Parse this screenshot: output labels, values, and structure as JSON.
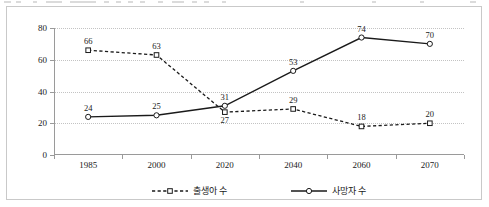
{
  "chart_data": {
    "type": "line",
    "title": "",
    "xlabel": "",
    "ylabel": "",
    "categories": [
      "1985",
      "2000",
      "2020",
      "2040",
      "2060",
      "2070"
    ],
    "ylim": [
      0,
      80
    ],
    "yticks": [
      0,
      20,
      40,
      60,
      80
    ],
    "grid": "horizontal-dotted",
    "legend_position": "bottom-center",
    "series": [
      {
        "name": "출생아 수",
        "values": [
          66,
          63,
          27,
          29,
          18,
          20
        ],
        "line_style": "dashed",
        "marker": "open-square",
        "color": "#1a1a1a",
        "label_positions": [
          "above",
          "above",
          "below",
          "above",
          "above",
          "above"
        ]
      },
      {
        "name": "사망자 수",
        "values": [
          24,
          25,
          31,
          53,
          74,
          70
        ],
        "line_style": "solid",
        "marker": "open-circle",
        "color": "#1a1a1a",
        "label_positions": [
          "above",
          "above",
          "above",
          "above",
          "above",
          "above"
        ]
      }
    ]
  },
  "legend": {
    "items": [
      {
        "label": "출생아 수",
        "style": "dashed",
        "marker": "open-square"
      },
      {
        "label": "사망자 수",
        "style": "solid",
        "marker": "open-circle"
      }
    ]
  },
  "axis": {
    "y_tick_labels": [
      "0",
      "20",
      "40",
      "60",
      "80"
    ],
    "x_tick_labels": [
      "1985",
      "2000",
      "2020",
      "2040",
      "2060",
      "2070"
    ]
  }
}
